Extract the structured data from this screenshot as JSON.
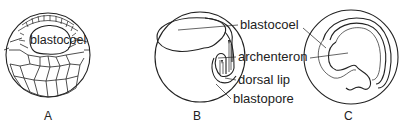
{
  "figure": {
    "panels": [
      {
        "id": "A",
        "label": "A",
        "inner_label": "blastocoel",
        "description": "blastula with blastocoel cavity surrounded by cells"
      },
      {
        "id": "B",
        "label": "B",
        "description": "early gastrula with invaginating archenteron"
      },
      {
        "id": "C",
        "label": "C",
        "description": "late gastrula with archenteron filling embryo"
      }
    ],
    "callouts": [
      {
        "text": "blastocoel"
      },
      {
        "text": "archenteron"
      },
      {
        "text": "dorsal lip"
      },
      {
        "text": "blastopore"
      }
    ]
  }
}
